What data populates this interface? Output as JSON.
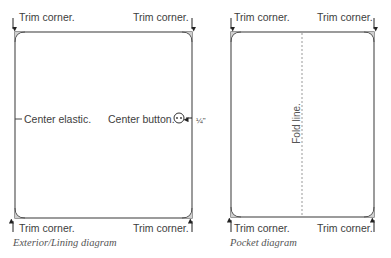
{
  "diagrams": [
    {
      "name": "exterior-lining",
      "caption": "Exterior/Lining diagram",
      "labels": {
        "top_left": "Trim corner.",
        "top_right": "Trim corner.",
        "bottom_left": "Trim corner.",
        "bottom_right": "Trim corner.",
        "center_elastic": "Center elastic.",
        "center_button": "Center button.",
        "button_offset": "¼\""
      }
    },
    {
      "name": "pocket",
      "caption": "Pocket diagram",
      "labels": {
        "top_left": "Trim corner.",
        "top_right": "Trim corner.",
        "bottom_left": "Trim corner.",
        "bottom_right": "Trim corner.",
        "fold_line": "Fold line."
      }
    }
  ],
  "colors": {
    "outline": "#555555",
    "fold_line": "#999999",
    "corner_fill": "#cccccc",
    "text": "#3d3d3d"
  }
}
